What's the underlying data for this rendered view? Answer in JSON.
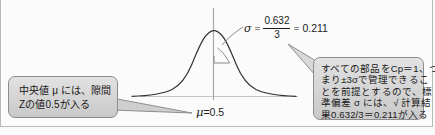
{
  "diagram": {
    "type": "normal-distribution-curve",
    "mean_label": {
      "symbol": "μ",
      "equals": "=0.5",
      "full": "μ =0.5"
    },
    "sigma_formula": {
      "symbol": "σ",
      "equals": "=",
      "numerator": "0.632",
      "denominator": "3",
      "result_equals": "=",
      "result": "0.211",
      "full": "σ = 0.632 / 3 = 0.211"
    },
    "axis": {
      "vertical_axis_name": "mean-axis",
      "baseline_name": "baseline"
    },
    "sigma_arc_name": "sigma-arc"
  },
  "callout_left": {
    "lines": [
      "中央値 μ には、隙間",
      "Zの値0.5が入る"
    ]
  },
  "callout_right": {
    "lines": [
      "すべての部品をCp＝1、つ",
      "まり±3σで管理できるこ",
      "とを前提とするので、標",
      "準偏差 σ には、√ 計算結",
      "果0.632/3＝0.211が入る"
    ]
  },
  "colors": {
    "background": "#fbfbfb",
    "curve": "#2a2a2a",
    "axis": "#9a9a9a",
    "callout_fill": "#d6d6d6",
    "callout_border": "#8d8d8d",
    "text": "#191919",
    "frame": "#b9b9b9"
  }
}
